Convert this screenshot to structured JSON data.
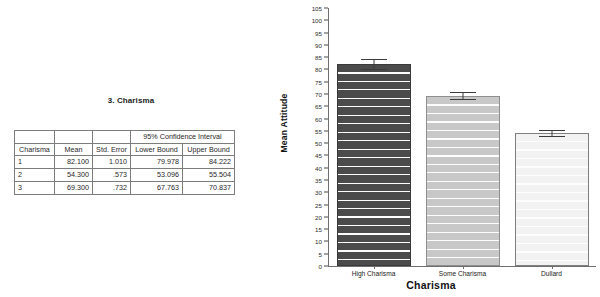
{
  "table": {
    "title": "3. Charisma",
    "measure_label": "Measure:",
    "measure_value": "MEASURE_1",
    "group_header": "95% Confidence Interval",
    "columns": [
      "Charisma",
      "Mean",
      "Std. Error",
      "Lower Bound",
      "Upper Bound"
    ],
    "rows": [
      {
        "charisma": "1",
        "mean": "82.100",
        "std_error": "1.010",
        "lower": "79.978",
        "upper": "84.222"
      },
      {
        "charisma": "2",
        "mean": "54.300",
        "std_error": ".573",
        "lower": "53.096",
        "upper": "55.504"
      },
      {
        "charisma": "3",
        "mean": "69.300",
        "std_error": ".732",
        "lower": "67.763",
        "upper": "70.837"
      }
    ]
  },
  "chart_data": {
    "type": "bar",
    "title": "",
    "xlabel": "Charisma",
    "ylabel": "Mean Attitude",
    "categories": [
      "High Charisma",
      "Some Charisma",
      "Dullard"
    ],
    "values": [
      82.1,
      69.3,
      54.3
    ],
    "error_lower": [
      79.978,
      67.763,
      53.096
    ],
    "error_upper": [
      84.222,
      70.837,
      55.504
    ],
    "error_type": "95% Confidence Interval",
    "ylim": [
      0,
      105
    ],
    "ytick_step": 5,
    "yticks": [
      "105",
      "100",
      "95",
      "90",
      "85",
      "80",
      "75",
      "70",
      "65",
      "60",
      "55",
      "50",
      "45",
      "40",
      "35",
      "30",
      "25",
      "20",
      "15",
      "10",
      "5",
      "0"
    ],
    "grid": false,
    "legend": "none",
    "bar_colors": [
      "#4b4b4b",
      "#c8c8c8",
      "#f2f2f2"
    ]
  }
}
